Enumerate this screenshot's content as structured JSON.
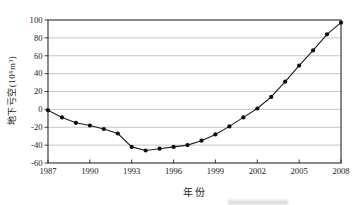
{
  "chart_data": {
    "type": "line",
    "title": "",
    "xlabel": "年份",
    "ylabel": "地下亏空(10⁶m³)",
    "x": [
      1987,
      1988,
      1989,
      1990,
      1991,
      1992,
      1993,
      1994,
      1995,
      1996,
      1997,
      1998,
      1999,
      2000,
      2001,
      2002,
      2003,
      2004,
      2005,
      2006,
      2007,
      2008
    ],
    "values": [
      -1,
      -9,
      -15,
      -18,
      -22,
      -27,
      -42,
      -46,
      -44,
      -42,
      -40,
      -35,
      -28,
      -19,
      -9,
      1,
      14,
      31,
      49,
      66,
      84,
      97
    ],
    "xlim": [
      1987,
      2008
    ],
    "ylim": [
      -60,
      100
    ],
    "xticks": [
      1987,
      1990,
      1993,
      1996,
      1999,
      2002,
      2005,
      2008
    ],
    "yticks": [
      -60,
      -40,
      -20,
      0,
      20,
      40,
      60,
      80,
      100
    ],
    "grid": "horizontal",
    "legend": "none",
    "line_color": "#1f1f1f",
    "marker": "circle",
    "marker_color": "#0d0d0d",
    "gridline_color": "#b8b8b8",
    "axis_color": "#2a2a2a",
    "plot_background": "#ffffff"
  }
}
